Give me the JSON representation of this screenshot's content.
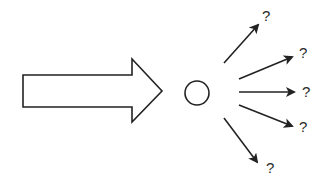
{
  "diagram": {
    "type": "divergence",
    "colors": {
      "stroke": "#222222",
      "fill": "#ffffff",
      "text": "#2a2a2a"
    },
    "input_arrow": {
      "shape": "block-arrow",
      "direction": "right"
    },
    "node": {
      "shape": "circle"
    },
    "outcomes": [
      {
        "label": "?"
      },
      {
        "label": "?"
      },
      {
        "label": "?"
      },
      {
        "label": "?"
      },
      {
        "label": "?"
      }
    ]
  }
}
